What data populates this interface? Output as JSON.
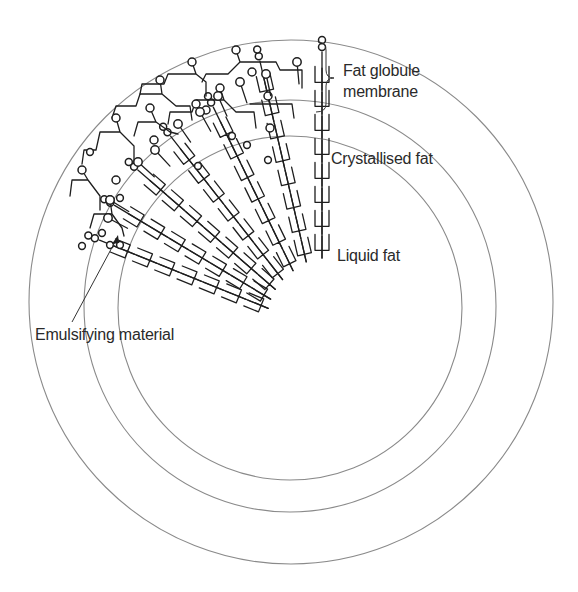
{
  "diagram": {
    "labels": {
      "membrane_line1": "Fat globule",
      "membrane_line2": "membrane",
      "crystallised": "Crystallised fat",
      "liquid": "Liquid fat",
      "emulsifying": "Emulsifying material"
    },
    "rings": [
      {
        "name": "outer-membrane-boundary",
        "cx": 291,
        "cy": 302,
        "r": 262
      },
      {
        "name": "inner-membrane-boundary",
        "cx": 290,
        "cy": 306,
        "r": 206
      },
      {
        "name": "fat-core-boundary",
        "cx": 290,
        "cy": 308,
        "r": 172
      }
    ],
    "colors": {
      "ring": "#8a8a8a",
      "ink": "#1e1e1e",
      "text": "#2a2a2a",
      "background": "#ffffff"
    }
  }
}
